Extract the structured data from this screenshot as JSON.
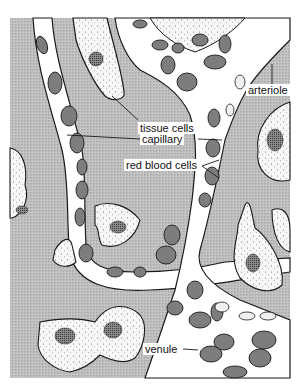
{
  "figure": {
    "colors": {
      "background_tissue": "#b8b8b8",
      "vessel_lumen": "#ffffff",
      "cell_body": "#f4f4f4",
      "rbc_fill": "#7a7a7a",
      "nucleus": "#5a5a5a",
      "outline": "#1a1a1a"
    }
  },
  "labels": {
    "tissue_cells": "tissue cells",
    "capillary": "capillary",
    "red_blood_cells": "red blood cells",
    "arteriole": "arteriole",
    "venule": "venule"
  }
}
